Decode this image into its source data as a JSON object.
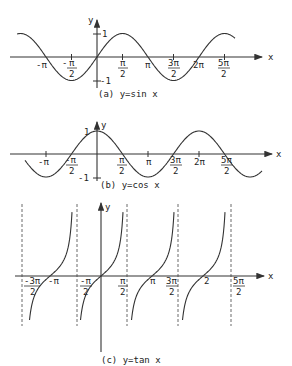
{
  "figure": {
    "panels": [
      {
        "id": "a",
        "caption": "(a) y=sin x",
        "ylabel": "y",
        "xlabel": "x",
        "yticks": [
          "1",
          "-1"
        ],
        "xticks": [
          "-π",
          "-π/2",
          "π/2",
          "π",
          "3π/2",
          "2π",
          "5π/2"
        ]
      },
      {
        "id": "b",
        "caption": "(b) y=cos x",
        "ylabel": "y",
        "xlabel": "x",
        "yticks": [
          "1",
          "-1"
        ],
        "xticks": [
          "-π",
          "-π/2",
          "π/2",
          "π",
          "3π/2",
          "2π",
          "5π/2"
        ]
      },
      {
        "id": "c",
        "caption": "(c) y=tan x",
        "ylabel": "y",
        "xlabel": "x",
        "xticks": [
          "-3π/2",
          "-π",
          "-π/2",
          "π/2",
          "π",
          "3π/2",
          "2",
          "5π/2"
        ]
      }
    ]
  },
  "chart_data": [
    {
      "type": "line",
      "title": "(a) y=sin x",
      "xlabel": "x",
      "ylabel": "y",
      "x_range": [
        "-1.6π",
        "2.7π"
      ],
      "ylim": [
        -1,
        1
      ],
      "x_tick_labels": [
        "-π",
        "-π/2",
        "π/2",
        "π",
        "3π/2",
        "2π",
        "5π/2"
      ],
      "y_tick_labels": [
        "1",
        "-1"
      ],
      "series": [
        {
          "name": "sin x",
          "function": "sin(x)"
        }
      ]
    },
    {
      "type": "line",
      "title": "(b) y=cos x",
      "xlabel": "x",
      "ylabel": "y",
      "x_range": [
        "-1.4π",
        "3.2π"
      ],
      "ylim": [
        -1,
        1
      ],
      "x_tick_labels": [
        "-π",
        "-π/2",
        "π/2",
        "π",
        "3π/2",
        "2π",
        "5π/2"
      ],
      "y_tick_labels": [
        "1",
        "-1"
      ],
      "series": [
        {
          "name": "cos x",
          "function": "cos(x)"
        }
      ]
    },
    {
      "type": "line",
      "title": "(c) y=tan x",
      "xlabel": "x",
      "ylabel": "y",
      "x_range": [
        "-3π/2",
        "5π/2"
      ],
      "asymptotes": [
        "-3π/2",
        "-π/2",
        "π/2",
        "3π/2",
        "5π/2"
      ],
      "x_tick_labels": [
        "-3π/2",
        "-π",
        "-π/2",
        "π/2",
        "π",
        "3π/2",
        "2",
        "5π/2"
      ],
      "series": [
        {
          "name": "tan x",
          "function": "tan(x)"
        }
      ]
    }
  ]
}
